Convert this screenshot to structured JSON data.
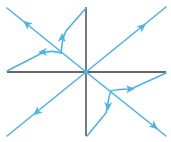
{
  "diagram": {
    "type": "phase-portrait",
    "colors": {
      "axis": "#333333",
      "trajectory": "#4db3e6",
      "background": "#ffffff"
    },
    "origin": [
      86,
      72
    ],
    "axes": {
      "horizontal": {
        "x1": 7,
        "y1": 72,
        "x2": 166,
        "y2": 72
      },
      "vertical": {
        "x1": 86,
        "y1": 7,
        "x2": 86,
        "y2": 136
      }
    },
    "straight_trajectories": [
      {
        "name": "toward-top-left",
        "d": "M86,72 L7,8",
        "arrow": {
          "x": 27,
          "y": 24,
          "angle": 219
        }
      },
      {
        "name": "toward-top-right",
        "d": "M86,72 L166,7",
        "arrow": {
          "x": 142,
          "y": 27,
          "angle": -39
        }
      },
      {
        "name": "toward-bottom-left",
        "d": "M86,72 L7,136",
        "arrow": {
          "x": 37,
          "y": 112,
          "angle": 141
        }
      },
      {
        "name": "toward-bottom-right",
        "d": "M86,72 L166,136",
        "arrow": {
          "x": 154,
          "y": 126,
          "angle": 39
        }
      }
    ],
    "curved_trajectories": [
      {
        "name": "upper-left-up",
        "d": "M61,53 C62,45 62,38 66,31 L86,8",
        "arrow": {
          "x": 62,
          "y": 38,
          "angle": -88
        }
      },
      {
        "name": "upper-left-left",
        "d": "M61,53 C55,51 48,51 42,53 L7,71",
        "arrow": {
          "x": 43,
          "y": 52,
          "angle": 178
        }
      },
      {
        "name": "lower-right-right",
        "d": "M111,91 C117,89 124,89 131,89 L166,73",
        "arrow": {
          "x": 130,
          "y": 89,
          "angle": -2
        }
      },
      {
        "name": "lower-right-down",
        "d": "M111,91 C108,98 108,105 106,113 L87,136",
        "arrow": {
          "x": 108,
          "y": 106,
          "angle": 92
        }
      }
    ]
  }
}
